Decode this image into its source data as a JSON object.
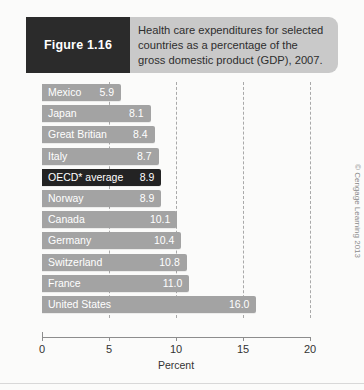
{
  "header": {
    "figure_badge": "Figure 1.16",
    "caption_line1": "Health care expenditures for selected",
    "caption_line2": "countries as a percentage of the",
    "caption_line3": "gross domestic product (GDP), 2007.",
    "badge_bg": "#2b2b2b",
    "banner_bg": "#c9c9c9"
  },
  "credit": "© Cengage Learning 2013",
  "chart_data": {
    "type": "bar",
    "orientation": "horizontal",
    "title": "Health care expenditures for selected countries as a percentage of the gross domestic product (GDP), 2007.",
    "xlabel": "Percent",
    "ylabel": "",
    "xlim": [
      0,
      20
    ],
    "xticks": [
      0,
      5,
      10,
      15,
      20
    ],
    "xtick_labels": [
      "0",
      "5",
      "10",
      "15",
      "20"
    ],
    "grid": true,
    "grid_style": "dashed-vertical",
    "legend": "none",
    "bar_color": "#a3a3a3",
    "highlight_color": "#232323",
    "categories": [
      "Mexico",
      "Japan",
      "Great Britian",
      "Italy",
      "OECD* average",
      "Norway",
      "Canada",
      "Germany",
      "Switzerland",
      "France",
      "United States"
    ],
    "values": [
      5.9,
      8.1,
      8.4,
      8.7,
      8.9,
      8.9,
      10.1,
      10.4,
      10.8,
      11.0,
      16.0
    ],
    "value_labels": [
      "5.9",
      "8.1",
      "8.4",
      "8.7",
      "8.9",
      "8.9",
      "10.1",
      "10.4",
      "10.8",
      "11.0",
      "16.0"
    ],
    "highlighted": [
      "OECD* average"
    ]
  }
}
